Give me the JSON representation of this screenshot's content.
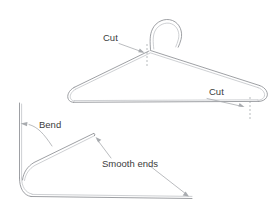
{
  "figure": {
    "title": "",
    "background_color": "#ffffff",
    "wire_color": "#8c8f93",
    "wire_highlight_color": "#b9bcc0",
    "leader_color": "#a8abaf",
    "dash_color": "#9a9da1",
    "text_color": "#3b3b3b"
  },
  "labels": {
    "cut_top": "Cut",
    "cut_right": "Cut",
    "bend": "Bend",
    "smooth_ends": "Smooth ends"
  },
  "annotations": [
    {
      "id": "cut-top",
      "text": "Cut",
      "text_x": 103,
      "text_y": 40,
      "leader_from": [
        120,
        42
      ],
      "leader_to": [
        143,
        52
      ],
      "marker": "dashed-vertical",
      "marker_x": 147,
      "marker_y1": 44,
      "marker_y2": 66
    },
    {
      "id": "cut-right",
      "text": "Cut",
      "text_x": 210,
      "text_y": 94,
      "leader_from": [
        206,
        98
      ],
      "leader_to": [
        243,
        107
      ],
      "marker": "dashed-vertical",
      "marker_x": 250,
      "marker_y1": 97,
      "marker_y2": 120
    },
    {
      "id": "bend",
      "text": "Bend",
      "text_x": 39,
      "text_y": 128,
      "leader_from": [
        52,
        146
      ],
      "leader_to": [
        20,
        124
      ],
      "marker": "curved-leader"
    },
    {
      "id": "smooth-ends-upper",
      "text": "Smooth ends",
      "text_x": 103,
      "text_y": 166,
      "leader_from": [
        110,
        158
      ],
      "leader_to": [
        96,
        139
      ],
      "marker": "arrow"
    },
    {
      "id": "smooth-ends-lower",
      "text": "",
      "leader_from": [
        150,
        166
      ],
      "leader_to": [
        188,
        196
      ],
      "marker": "arrow"
    }
  ],
  "objects": {
    "hanger": {
      "name": "wire-coat-hanger",
      "apex": [
        148,
        50
      ],
      "hook_center": [
        163,
        25
      ],
      "hook_radius": 14,
      "left_corner": [
        72,
        90
      ],
      "right_corner": [
        262,
        90
      ],
      "bottom_bar_y": 99
    },
    "bent_wire": {
      "name": "bent-hanger-wire",
      "vertical_top": [
        20,
        103
      ],
      "corner": [
        22,
        190
      ],
      "bottom_right": [
        192,
        198
      ],
      "diagonal_tip": [
        94,
        134
      ]
    }
  }
}
